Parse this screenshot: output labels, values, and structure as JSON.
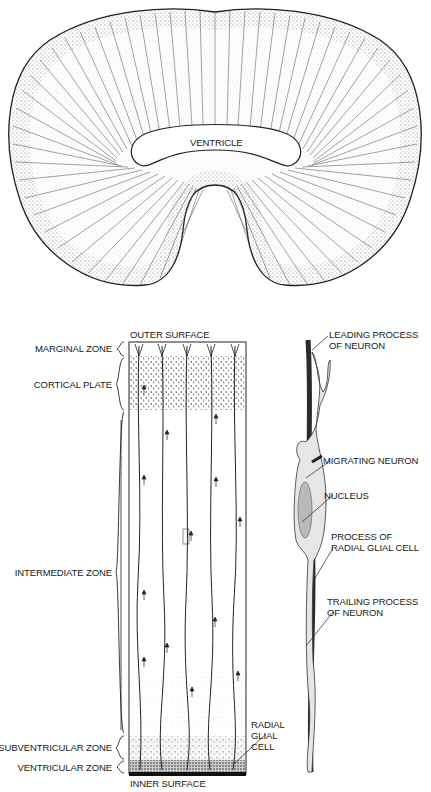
{
  "top_section": {
    "ventricle_label": "VENTRICLE"
  },
  "column": {
    "top_label": "OUTER SURFACE",
    "bottom_label": "INNER SURFACE",
    "zones": [
      {
        "label": "MARGINAL ZONE"
      },
      {
        "label": "CORTICAL PLATE"
      },
      {
        "label": "INTERMEDIATE ZONE"
      },
      {
        "label": "SUBVENTRICULAR ZONE"
      },
      {
        "label": "VENTRICULAR ZONE"
      }
    ],
    "radial_glial_label_lines": [
      "RADIAL",
      "GLIAL",
      "CELL"
    ]
  },
  "detail": {
    "labels": [
      {
        "lines": [
          "LEADING PROCESS",
          "OF NEURON"
        ]
      },
      {
        "lines": [
          "MIGRATING NEURON"
        ]
      },
      {
        "lines": [
          "NUCLEUS"
        ]
      },
      {
        "lines": [
          "PROCESS OF",
          "RADIAL GLIAL CELL"
        ]
      },
      {
        "lines": [
          "TRAILING PROCESS",
          "OF NEURON"
        ]
      }
    ]
  },
  "colors": {
    "ink": "#1a1a1a",
    "stipple": "#6e6e6e",
    "glial_process": "#2b2b2b",
    "neuron_fill": "#e4e4e4"
  }
}
